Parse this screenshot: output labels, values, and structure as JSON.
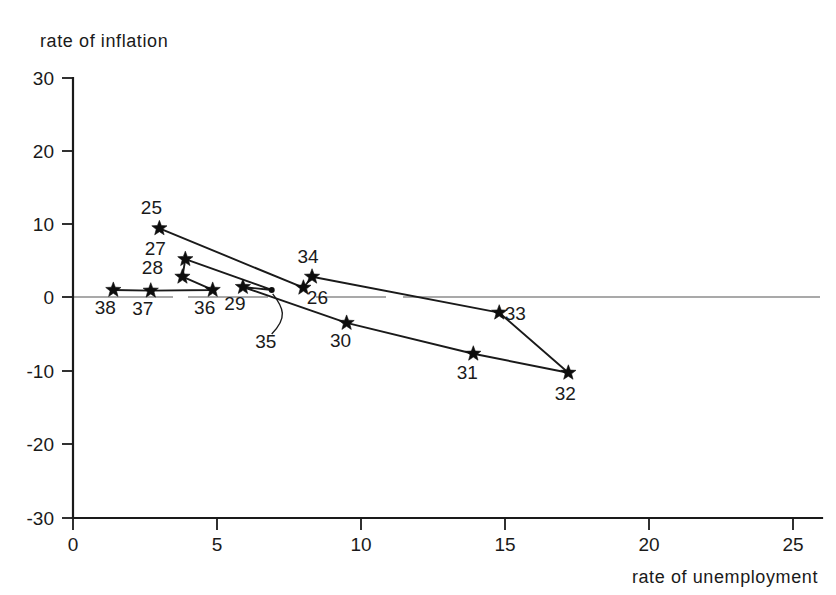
{
  "chart_data": {
    "type": "scatter",
    "title": "",
    "subtitle": "",
    "xlabel": "rate of unemployment",
    "ylabel": "rate of inflation",
    "xlim": [
      0,
      26
    ],
    "ylim": [
      -30,
      30
    ],
    "xticks": [
      "0",
      "5",
      "10",
      "15",
      "20",
      "25"
    ],
    "xtick_values": [
      0,
      5,
      10,
      15,
      20,
      25
    ],
    "yticks": [
      "30",
      "20",
      "10",
      "0",
      "-10",
      "-20",
      "-30"
    ],
    "ytick_values": [
      30,
      20,
      10,
      0,
      -10,
      -20,
      -30
    ],
    "grid": false,
    "legend": "none",
    "connected": true,
    "marker": "star",
    "annotations": [
      "Points are labelled by year (1925-1938); a connecting line traces the chronological path.",
      "A faint horizontal reference line is drawn at rate of inflation = 0."
    ],
    "points": [
      {
        "label": "25",
        "x": 3.0,
        "y": 9.5,
        "label_dx": -8,
        "label_dy": -14,
        "marker": "star"
      },
      {
        "label": "26",
        "x": 8.0,
        "y": 1.4,
        "label_dx": 14,
        "label_dy": 16,
        "marker": "star"
      },
      {
        "label": "27",
        "x": 3.9,
        "y": 5.3,
        "label_dx": -30,
        "label_dy": -4,
        "marker": "star"
      },
      {
        "label": "28",
        "x": 3.8,
        "y": 2.9,
        "label_dx": -30,
        "label_dy": -3,
        "marker": "star"
      },
      {
        "label": "29",
        "x": 5.9,
        "y": 1.5,
        "label_dx": -8,
        "label_dy": 23,
        "marker": "star"
      },
      {
        "label": "30",
        "x": 9.5,
        "y": -3.4,
        "label_dx": -6,
        "label_dy": 24,
        "marker": "star"
      },
      {
        "label": "31",
        "x": 13.9,
        "y": -7.6,
        "label_dx": -6,
        "label_dy": 25,
        "marker": "star"
      },
      {
        "label": "32",
        "x": 17.2,
        "y": -10.2,
        "label_dx": -3,
        "label_dy": 27,
        "marker": "star"
      },
      {
        "label": "33",
        "x": 14.8,
        "y": -2.0,
        "label_dx": 16,
        "label_dy": 7,
        "marker": "star"
      },
      {
        "label": "34",
        "x": 8.3,
        "y": 2.9,
        "label_dx": -4,
        "label_dy": -14,
        "marker": "star"
      },
      {
        "label": "35",
        "x": 6.9,
        "y": 1.1,
        "label_dx": -6,
        "label_dy": 58,
        "marker": "dot"
      },
      {
        "label": "36",
        "x": 4.85,
        "y": 1.1,
        "label_dx": -8,
        "label_dy": 24,
        "marker": "star"
      },
      {
        "label": "37",
        "x": 2.7,
        "y": 1.0,
        "label_dx": -8,
        "label_dy": 24,
        "marker": "star"
      },
      {
        "label": "38",
        "x": 1.4,
        "y": 1.1,
        "label_dx": -8,
        "label_dy": 24,
        "marker": "star"
      }
    ],
    "path_order": [
      "25",
      "26",
      "34",
      "33",
      "32",
      "31",
      "30",
      "29",
      "35",
      "27",
      "28",
      "36",
      "37",
      "38"
    ]
  }
}
